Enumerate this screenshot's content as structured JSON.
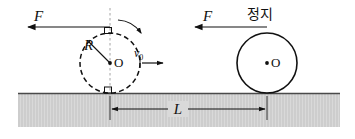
{
  "figure": {
    "canvas": {
      "width": 355,
      "height": 139,
      "background": "#ffffff"
    },
    "colors": {
      "stroke": "#111111",
      "ground_fill": "#d9d9d9",
      "ground_hatch": "#c2c2c2",
      "ground_top_line": "#4a4a4a",
      "dotted_axis": "#9a9a9a"
    },
    "labels": {
      "force_left": "F",
      "force_right": "F",
      "state_right": "정지",
      "radius": "R",
      "center_left": "O",
      "center_right": "O",
      "velocity": "v",
      "velocity_subscript": "0",
      "distance": "L"
    },
    "objects": {
      "left_cylinder": {
        "name": "rolling-cylinder",
        "center_x": 110,
        "center_y": 63,
        "radius": 30,
        "outline": "dashed",
        "has_center_dot": true,
        "has_vertical_axis": true,
        "has_rotation_arrow": true,
        "has_right_angle_markers": true
      },
      "right_cylinder": {
        "name": "stationary-cylinder",
        "center_x": 267,
        "center_y": 63,
        "radius": 30,
        "outline": "solid",
        "has_center_dot": true
      },
      "ground": {
        "name": "ground-surface",
        "x": 18,
        "y": 93,
        "width": 322,
        "height": 34
      },
      "force_arrow_left": {
        "from_x": 110,
        "to_x": 28,
        "y": 27
      },
      "force_arrow_right": {
        "from_x": 267,
        "to_x": 195,
        "y": 27
      },
      "velocity_arrow": {
        "from_x": 141,
        "to_x": 163,
        "y": 63
      },
      "distance_arrow": {
        "from_x": 110,
        "to_x": 267,
        "y": 109
      },
      "radius_line": {
        "from_x": 110,
        "from_y": 63,
        "to_x": 89,
        "to_y": 42
      },
      "rotation_arrow": {
        "description": "clockwise-arc-over-top-of-left-cylinder"
      }
    }
  }
}
